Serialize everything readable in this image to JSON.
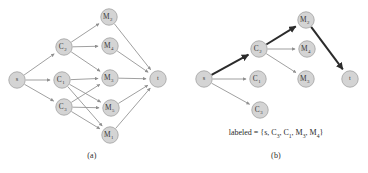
{
  "figure": {
    "panels": [
      {
        "id": "a",
        "caption": "(a)",
        "nodes": [
          {
            "id": "s",
            "base": "s",
            "sub": "",
            "x": 17,
            "y": 80
          },
          {
            "id": "C2",
            "base": "C",
            "sub": "2",
            "x": 64,
            "y": 47
          },
          {
            "id": "C1",
            "base": "C",
            "sub": "1",
            "x": 62,
            "y": 80
          },
          {
            "id": "C3",
            "base": "C",
            "sub": "3",
            "x": 64,
            "y": 107
          },
          {
            "id": "M2",
            "base": "M",
            "sub": "2",
            "x": 109,
            "y": 17
          },
          {
            "id": "M4",
            "base": "M",
            "sub": "4",
            "x": 110,
            "y": 46
          },
          {
            "id": "M3",
            "base": "M",
            "sub": "3",
            "x": 110,
            "y": 78
          },
          {
            "id": "M5",
            "base": "M",
            "sub": "5",
            "x": 111,
            "y": 108
          },
          {
            "id": "M1",
            "base": "M",
            "sub": "1",
            "x": 110,
            "y": 135
          },
          {
            "id": "t",
            "base": "t",
            "sub": "",
            "x": 158,
            "y": 79
          }
        ],
        "edges": [
          {
            "from": "s",
            "to": "C2",
            "bold": false
          },
          {
            "from": "s",
            "to": "C1",
            "bold": false
          },
          {
            "from": "s",
            "to": "C3",
            "bold": false
          },
          {
            "from": "C2",
            "to": "M2",
            "bold": false
          },
          {
            "from": "C2",
            "to": "M4",
            "bold": false
          },
          {
            "from": "C2",
            "to": "M3",
            "bold": false
          },
          {
            "from": "C1",
            "to": "M3",
            "bold": false
          },
          {
            "from": "C1",
            "to": "M5",
            "bold": false
          },
          {
            "from": "C1",
            "to": "M1",
            "bold": false
          },
          {
            "from": "C3",
            "to": "M3",
            "bold": false
          },
          {
            "from": "C3",
            "to": "M5",
            "bold": false
          },
          {
            "from": "C3",
            "to": "M1",
            "bold": false
          },
          {
            "from": "M2",
            "to": "t",
            "bold": false
          },
          {
            "from": "M4",
            "to": "t",
            "bold": false
          },
          {
            "from": "M3",
            "to": "t",
            "bold": false
          },
          {
            "from": "M5",
            "to": "t",
            "bold": false
          },
          {
            "from": "M1",
            "to": "t",
            "bold": false
          }
        ]
      },
      {
        "id": "b",
        "caption": "(b)",
        "labeled_prefix": "labeled = {",
        "labeled_suffix": "}",
        "labeled_set": [
          "s",
          "C3",
          "C1",
          "M3",
          "M4"
        ],
        "labeled_display": "labeled = {s, C3, C1, M3, M4}",
        "nodes": [
          {
            "id": "s",
            "base": "s",
            "sub": "",
            "x": 20,
            "y": 79
          },
          {
            "id": "C2",
            "base": "C",
            "sub": "2",
            "x": 75,
            "y": 49
          },
          {
            "id": "C1",
            "base": "C",
            "sub": "1",
            "x": 74,
            "y": 79
          },
          {
            "id": "C3",
            "base": "C",
            "sub": "3",
            "x": 76,
            "y": 110
          },
          {
            "id": "M2",
            "base": "M",
            "sub": "2",
            "x": 122,
            "y": 20
          },
          {
            "id": "M4",
            "base": "M",
            "sub": "4",
            "x": 123,
            "y": 49
          },
          {
            "id": "M3",
            "base": "M",
            "sub": "3",
            "x": 122,
            "y": 79
          },
          {
            "id": "t",
            "base": "t",
            "sub": "",
            "x": 166,
            "y": 79
          }
        ],
        "edges": [
          {
            "from": "s",
            "to": "C2",
            "bold": true
          },
          {
            "from": "s",
            "to": "C1",
            "bold": false
          },
          {
            "from": "s",
            "to": "C3",
            "bold": false
          },
          {
            "from": "C2",
            "to": "M2",
            "bold": true
          },
          {
            "from": "C2",
            "to": "M4",
            "bold": false
          },
          {
            "from": "C2",
            "to": "M3",
            "bold": false
          },
          {
            "from": "M2",
            "to": "t",
            "bold": true
          }
        ]
      }
    ]
  },
  "style": {
    "node_fill": "#d4d4d4",
    "node_stroke": "#a8a8a8",
    "edge_color": "#8f8f8f",
    "edge_bold_color": "#2b2b2b",
    "text_color": "#3a3a3a",
    "background": "#ffffff",
    "node_radius": 8.2
  }
}
